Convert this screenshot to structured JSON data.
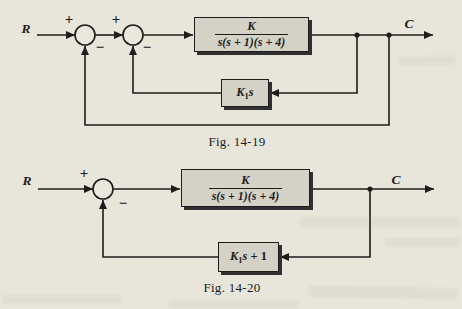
{
  "theme": {
    "page-bg": "#e8e5da",
    "ink": "#1c1c1c",
    "block-fill": "#d4d2c6",
    "block-shadow": "#303030"
  },
  "fig1": {
    "caption": "Fig. 14-19",
    "input_label": "R",
    "output_label": "C",
    "sum1": {
      "plus": "+",
      "minus": "−"
    },
    "sum2": {
      "plus": "+",
      "minus": "−"
    },
    "forward_block": {
      "numerator": "K",
      "denominator": "s(s + 1)(s + 4)"
    },
    "feedback_block": {
      "coef": "K",
      "sub": "1",
      "var": "s"
    }
  },
  "fig2": {
    "caption": "Fig. 14-20",
    "input_label": "R",
    "output_label": "C",
    "sum": {
      "plus": "+",
      "minus": "−"
    },
    "forward_block": {
      "numerator": "K",
      "denominator": "s(s + 1)(s + 4)"
    },
    "feedback_block": {
      "coef": "K",
      "sub": "1",
      "var": "s",
      "rest": " + 1"
    }
  }
}
